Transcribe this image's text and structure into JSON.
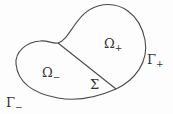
{
  "diagram": {
    "type": "domain-partition",
    "colors": {
      "stroke": "#4a4a4a",
      "text": "#333333",
      "background": "#fdfdfd"
    },
    "labels": {
      "omega_plus": {
        "base": "Ω",
        "sub": "+"
      },
      "omega_minus": {
        "base": "Ω",
        "sub": "−"
      },
      "sigma": {
        "base": "Σ"
      },
      "gamma_plus": {
        "base": "Γ",
        "sub": "+"
      },
      "gamma_minus": {
        "base": "Γ",
        "sub": "−"
      }
    }
  }
}
